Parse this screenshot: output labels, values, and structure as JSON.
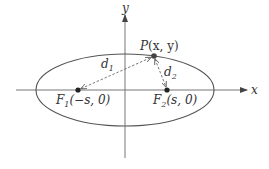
{
  "diagram": {
    "colors": {
      "background": "#ffffff",
      "stroke": "#555555",
      "point": "#222222",
      "text": "#333333"
    },
    "axes": {
      "x_label": "x",
      "y_label": "y"
    },
    "ellipse": {
      "cx": 125,
      "cy": 90,
      "rx": 89,
      "ry": 36
    },
    "points": {
      "f1": {
        "name": "F",
        "sub": "1",
        "coords": "(−s, 0)",
        "x": 78,
        "y": 90
      },
      "f2": {
        "name": "F",
        "sub": "2",
        "coords": "(s, 0)",
        "x": 167,
        "y": 90
      },
      "p": {
        "name": "P",
        "coords": "(x, y)",
        "x": 154,
        "y": 56
      }
    },
    "distances": {
      "d1": {
        "name": "d",
        "sub": "1"
      },
      "d2": {
        "name": "d",
        "sub": "2"
      }
    }
  }
}
